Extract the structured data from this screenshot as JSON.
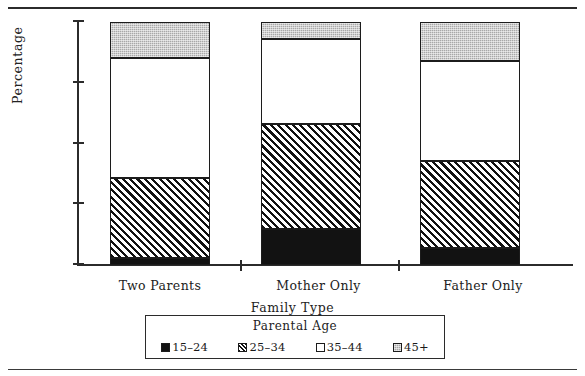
{
  "chart_data": {
    "type": "bar",
    "subtype": "stacked-bar-100",
    "title": "",
    "xlabel": "Family  Type",
    "ylabel": "Percentage",
    "categories": [
      "Two  Parents",
      "Mother  Only",
      "Father  Only"
    ],
    "ylim": [
      0,
      100
    ],
    "yticks": [
      "0",
      "25",
      "50",
      "75",
      "100"
    ],
    "ytick_values": [
      0,
      25,
      50,
      75,
      100
    ],
    "grid": false,
    "legend_position": "below-axes",
    "legend_title": "Parental   Age",
    "series": [
      {
        "name": "15–24",
        "fill": "solid-black",
        "color": "#121212",
        "values": [
          3,
          15,
          7
        ]
      },
      {
        "name": "25–34",
        "fill": "diagonal-hatch",
        "color": "#ffffff",
        "values": [
          33,
          43,
          36
        ]
      },
      {
        "name": "35–44",
        "fill": "white",
        "color": "#ffffff",
        "values": [
          49,
          35,
          41
        ]
      },
      {
        "name": "45+",
        "fill": "gray-stipple",
        "color": "#a8a8a8",
        "values": [
          15,
          7,
          16
        ]
      }
    ],
    "stack_tops": {
      "Two  Parents": [
        3,
        36,
        85,
        100
      ],
      "Mother  Only": [
        15,
        58,
        93,
        100
      ],
      "Father  Only": [
        7,
        43,
        84,
        100
      ]
    },
    "axis_ticks_x": [
      "Two  Parents",
      "Mother  Only",
      "Father  Only"
    ]
  },
  "figure": {
    "caption_fragment": "",
    "top_rule": true,
    "bottom_rule": true
  }
}
